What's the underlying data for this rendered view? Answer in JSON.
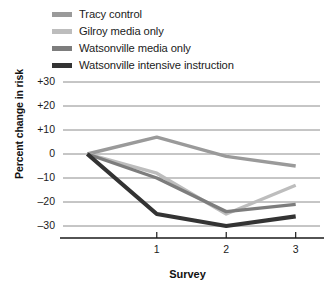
{
  "chart_data": {
    "type": "line",
    "title": "",
    "xlabel": "Survey",
    "ylabel": "Percent change in risk",
    "x": [
      0,
      1,
      2,
      3
    ],
    "categories": [
      "",
      "1",
      "2",
      "3"
    ],
    "xticks": [
      "1",
      "2",
      "3"
    ],
    "yticks": [
      "+30",
      "+20",
      "+10",
      "0",
      "–10",
      "–20",
      "–30"
    ],
    "ytickvalues": [
      30,
      20,
      10,
      0,
      -10,
      -20,
      -30
    ],
    "ylim": [
      -35,
      30
    ],
    "xlim": [
      -0.35,
      3.35
    ],
    "grid": true,
    "legend_position": "top-left",
    "series": [
      {
        "name": "Tracy control",
        "color": "#9a9a9a",
        "values": [
          0,
          7,
          -1,
          -5
        ]
      },
      {
        "name": "Gilroy media only",
        "color": "#bdbdbd",
        "values": [
          0,
          -8,
          -25,
          -13
        ]
      },
      {
        "name": "Watsonville media only",
        "color": "#7d7d7d",
        "values": [
          0,
          -10,
          -24,
          -21
        ]
      },
      {
        "name": "Watsonville intensive instruction",
        "color": "#333333",
        "values": [
          0,
          -25,
          -30,
          -26
        ]
      }
    ]
  },
  "legend": {
    "items": [
      {
        "label": "Tracy control",
        "color": "#9a9a9a"
      },
      {
        "label": "Gilroy media only",
        "color": "#bdbdbd"
      },
      {
        "label": "Watsonville media only",
        "color": "#7d7d7d"
      },
      {
        "label": "Watsonville intensive instruction",
        "color": "#333333"
      }
    ]
  },
  "axes": {
    "y_title": "Percent change in risk",
    "x_title": "Survey",
    "y_ticks": [
      "+30",
      "+20",
      "+10",
      "0",
      "–10",
      "–20",
      "–30"
    ],
    "x_ticks": [
      "1",
      "2",
      "3"
    ]
  },
  "colors": {
    "grid": "#6f6f6f",
    "axis": "#1a1a1a",
    "text": "#1b1b1b",
    "background": "#ffffff"
  }
}
